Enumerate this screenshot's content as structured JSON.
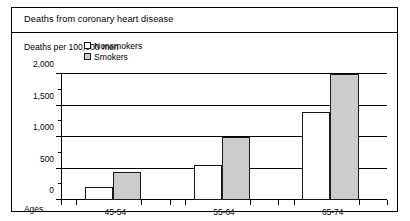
{
  "figure": {
    "title": "Deaths from coronary heart disease"
  },
  "chart_data": {
    "type": "bar",
    "title": "Deaths from coronary heart disease",
    "ylabel": "Deaths per 100,000 men",
    "xlabel": "Ages",
    "categories": [
      "45-54",
      "55-64",
      "65-74"
    ],
    "series": [
      {
        "name": "Nonsmokers",
        "color": "#ffffff",
        "values": [
          200,
          560,
          1400
        ]
      },
      {
        "name": "Smokers",
        "color": "#cccccc",
        "values": [
          450,
          1000,
          2000
        ]
      }
    ],
    "ylim": [
      0,
      2000
    ],
    "ytick_labels": [
      "0",
      "500",
      "1,000",
      "1,500",
      "2,000"
    ],
    "ytick_values": [
      0,
      500,
      1000,
      1500,
      2000
    ],
    "yminor_values": [
      250,
      750,
      1250,
      1750
    ],
    "grid": true,
    "legend_position": "top-left"
  }
}
